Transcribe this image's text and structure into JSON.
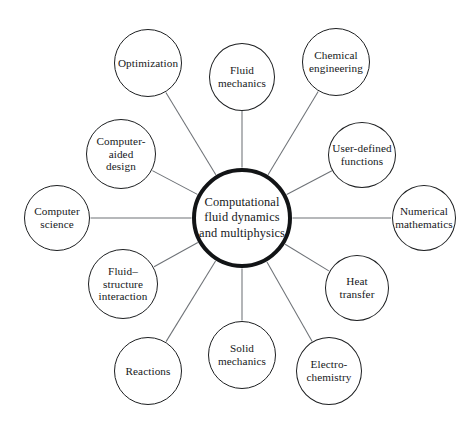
{
  "diagram": {
    "background_color": "#ffffff",
    "line_color": "#6e7277",
    "node_border_color": "#1d1f21",
    "hub_border_color": "#121416",
    "text_color": "#16181a",
    "hub": {
      "label": "Computational fluid dynamics and multiphysics",
      "lines": [
        "Computational",
        "fluid dynamics",
        "and multiphysics"
      ],
      "cx": 242,
      "cy": 218,
      "r": 50,
      "border_width": 4.2
    },
    "satellites": [
      {
        "id": "optimization",
        "label": "Optimization",
        "lines": [
          "Optimization"
        ],
        "cx": 148,
        "cy": 63,
        "rx": 34,
        "ry": 34
      },
      {
        "id": "fluid-mechanics",
        "label": "Fluid mechanics",
        "lines": [
          "Fluid",
          "mechanics"
        ],
        "cx": 242,
        "cy": 77,
        "rx": 33,
        "ry": 34
      },
      {
        "id": "chemical-engineering",
        "label": "Chemical engineering",
        "lines": [
          "Chemical",
          "engineering"
        ],
        "cx": 336,
        "cy": 62,
        "rx": 34,
        "ry": 34
      },
      {
        "id": "user-defined-functions",
        "label": "User-defined functions",
        "lines": [
          "User-defined",
          "functions"
        ],
        "cx": 362,
        "cy": 155,
        "rx": 34,
        "ry": 33
      },
      {
        "id": "numerical-mathematics",
        "label": "Numerical mathematics",
        "lines": [
          "Numerical",
          "mathematics"
        ],
        "cx": 424,
        "cy": 218,
        "rx": 32,
        "ry": 33
      },
      {
        "id": "heat-transfer",
        "label": "Heat transfer",
        "lines": [
          "Heat",
          "transfer"
        ],
        "cx": 357,
        "cy": 288,
        "rx": 32,
        "ry": 33
      },
      {
        "id": "electro-chemistry",
        "label": "Electro-chemistry",
        "lines": [
          "Electro-",
          "chemistry"
        ],
        "cx": 329,
        "cy": 371,
        "rx": 33,
        "ry": 34
      },
      {
        "id": "solid-mechanics",
        "label": "Solid mechanics",
        "lines": [
          "Solid",
          "mechanics"
        ],
        "cx": 242,
        "cy": 355,
        "rx": 34,
        "ry": 34
      },
      {
        "id": "reactions",
        "label": "Reactions",
        "lines": [
          "Reactions"
        ],
        "cx": 148,
        "cy": 371,
        "rx": 34,
        "ry": 34
      },
      {
        "id": "fluid-structure-interaction",
        "label": "Fluid–structure interaction",
        "lines": [
          "Fluid–",
          "structure",
          "interaction"
        ],
        "cx": 123,
        "cy": 284,
        "rx": 35,
        "ry": 35
      },
      {
        "id": "computer-science",
        "label": "Computer science",
        "lines": [
          "Computer",
          "science"
        ],
        "cx": 57,
        "cy": 218,
        "rx": 33,
        "ry": 33
      },
      {
        "id": "computer-aided-design",
        "label": "Computer-aided design",
        "lines": [
          "Computer-",
          "aided",
          "design"
        ],
        "cx": 121,
        "cy": 154,
        "rx": 35,
        "ry": 35
      }
    ]
  }
}
